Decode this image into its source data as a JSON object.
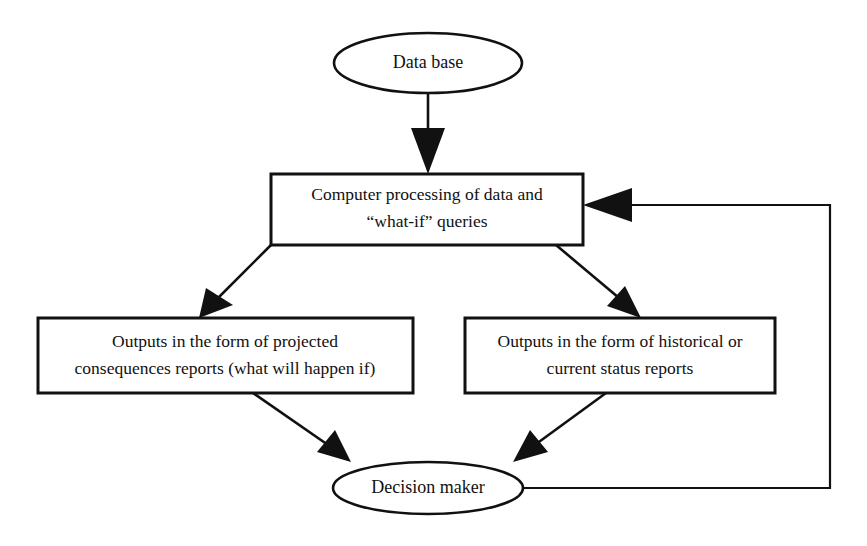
{
  "diagram": {
    "canvas": {
      "width": 867,
      "height": 546,
      "background": "#ffffff"
    },
    "stroke_color": "#111111",
    "fill_color": "#ffffff",
    "nodes": {
      "database": {
        "shape": "ellipse",
        "label": "Data base",
        "cx": 428,
        "cy": 63,
        "rx": 94,
        "ry": 30
      },
      "processing": {
        "shape": "rectangle",
        "label_line1": "Computer processing of data and",
        "label_line2": "“what-if” queries",
        "x": 271,
        "y": 174,
        "width": 312,
        "height": 71
      },
      "projected_output": {
        "shape": "rectangle",
        "label_line1": "Outputs in the form of projected",
        "label_line2": "consequences reports (what will happen if)",
        "x": 38,
        "y": 318,
        "width": 375,
        "height": 75
      },
      "historical_output": {
        "shape": "rectangle",
        "label_line1": "Outputs in the form of historical or",
        "label_line2": "current status reports",
        "x": 465,
        "y": 318,
        "width": 310,
        "height": 75
      },
      "decision_maker": {
        "shape": "ellipse",
        "label": "Decision maker",
        "cx": 428,
        "cy": 488,
        "rx": 95,
        "ry": 26
      }
    },
    "edges": [
      {
        "id": "database-to-processing",
        "from": "database",
        "to": "processing",
        "style": "straight-vertical-arrow"
      },
      {
        "id": "processing-to-projected",
        "from": "processing",
        "to": "projected_output",
        "style": "diagonal-arrow"
      },
      {
        "id": "processing-to-historical",
        "from": "processing",
        "to": "historical_output",
        "style": "diagonal-arrow"
      },
      {
        "id": "projected-to-decision",
        "from": "projected_output",
        "to": "decision_maker",
        "style": "diagonal-arrow"
      },
      {
        "id": "historical-to-decision",
        "from": "historical_output",
        "to": "decision_maker",
        "style": "diagonal-arrow"
      },
      {
        "id": "decision-feedback-to-processing",
        "from": "decision_maker",
        "to": "processing",
        "style": "orthogonal-feedback-arrow"
      }
    ]
  }
}
